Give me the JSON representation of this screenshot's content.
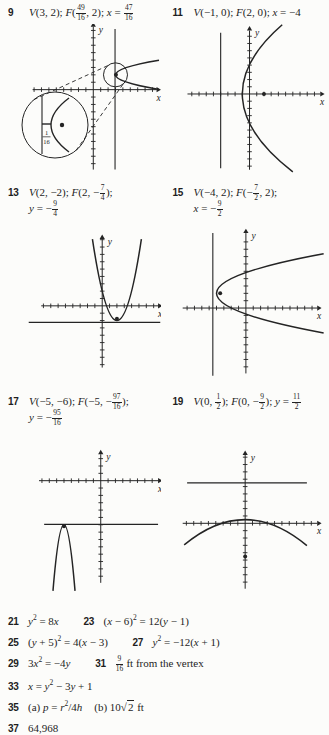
{
  "colors": {
    "ink": "#242424",
    "paper": "#fcfcfa"
  },
  "rows": [
    {
      "items": [
        {
          "num": "9",
          "lines": [
            [
              {
                "i": "V"
              },
              {
                "t": "(3, 2); "
              },
              {
                "i": "F"
              },
              {
                "t": "("
              },
              {
                "f": [
                  "49",
                  "16"
                ]
              },
              {
                "t": ", 2); "
              },
              {
                "i": "x"
              },
              {
                "t": " = "
              },
              {
                "f": [
                  "47",
                  "16"
                ]
              }
            ]
          ]
        },
        {
          "num": "11",
          "lines": [
            [
              {
                "i": "V"
              },
              {
                "t": "(−1, 0); "
              },
              {
                "i": "F"
              },
              {
                "t": "(2, 0); "
              },
              {
                "i": "x"
              },
              {
                "t": " = −4"
              }
            ]
          ]
        }
      ]
    },
    {
      "items": [
        {
          "num": "13",
          "lines": [
            [
              {
                "i": "V"
              },
              {
                "t": "(2, −2); "
              },
              {
                "i": "F"
              },
              {
                "t": "(2, −"
              },
              {
                "f": [
                  "7",
                  "4"
                ]
              },
              {
                "t": ");"
              }
            ],
            [
              {
                "i": "y"
              },
              {
                "t": " = −"
              },
              {
                "f": [
                  "9",
                  "4"
                ]
              }
            ]
          ]
        },
        {
          "num": "15",
          "lines": [
            [
              {
                "i": "V"
              },
              {
                "t": "(−4, 2); "
              },
              {
                "i": "F"
              },
              {
                "t": "(−"
              },
              {
                "f": [
                  "7",
                  "2"
                ]
              },
              {
                "t": ", 2);"
              }
            ],
            [
              {
                "i": "x"
              },
              {
                "t": " = −"
              },
              {
                "f": [
                  "9",
                  "2"
                ]
              }
            ]
          ]
        }
      ]
    },
    {
      "items": [
        {
          "num": "17",
          "lines": [
            [
              {
                "i": "V"
              },
              {
                "t": "(−5, −6); "
              },
              {
                "i": "F"
              },
              {
                "t": "(−5, −"
              },
              {
                "f": [
                  "97",
                  "16"
                ]
              },
              {
                "t": ");"
              }
            ],
            [
              {
                "i": "y"
              },
              {
                "t": " = −"
              },
              {
                "f": [
                  "95",
                  "16"
                ]
              }
            ]
          ]
        },
        {
          "num": "19",
          "lines": [
            [
              {
                "i": "V"
              },
              {
                "t": "(0, "
              },
              {
                "f": [
                  "1",
                  "2"
                ]
              },
              {
                "t": "); "
              },
              {
                "i": "F"
              },
              {
                "t": "(0, −"
              },
              {
                "f": [
                  "9",
                  "2"
                ]
              },
              {
                "t": "); "
              },
              {
                "i": "y"
              },
              {
                "t": " = "
              },
              {
                "f": [
                  "11",
                  "2"
                ]
              }
            ]
          ]
        }
      ]
    }
  ],
  "bottom": {
    "lines": [
      {
        "items": [
          {
            "num": "21",
            "segs": [
              {
                "i": "y"
              },
              {
                "sup": "2"
              },
              {
                "t": " = 8"
              },
              {
                "i": "x"
              }
            ]
          },
          {
            "num": "23",
            "segs": [
              {
                "t": "("
              },
              {
                "i": "x"
              },
              {
                "t": " − 6)"
              },
              {
                "sup": "2"
              },
              {
                "t": " = 12("
              },
              {
                "i": "y"
              },
              {
                "t": " − 1)"
              }
            ]
          }
        ]
      },
      {
        "items": [
          {
            "num": "25",
            "segs": [
              {
                "t": "("
              },
              {
                "i": "y"
              },
              {
                "t": " + 5)"
              },
              {
                "sup": "2"
              },
              {
                "t": " = 4("
              },
              {
                "i": "x"
              },
              {
                "t": " − 3)"
              }
            ]
          },
          {
            "num": "27",
            "segs": [
              {
                "i": "y"
              },
              {
                "sup": "2"
              },
              {
                "t": " = −12("
              },
              {
                "i": "x"
              },
              {
                "t": " + 1)"
              }
            ]
          }
        ]
      },
      {
        "items": [
          {
            "num": "29",
            "segs": [
              {
                "t": "3"
              },
              {
                "i": "x"
              },
              {
                "sup": "2"
              },
              {
                "t": " = −4"
              },
              {
                "i": "y"
              }
            ]
          },
          {
            "num": "31",
            "segs": [
              {
                "f": [
                  "9",
                  "16"
                ]
              },
              {
                "t": " ft from the vertex"
              }
            ]
          }
        ]
      },
      {
        "items": [
          {
            "num": "33",
            "segs": [
              {
                "i": "x"
              },
              {
                "t": " = "
              },
              {
                "i": "y"
              },
              {
                "sup": "2"
              },
              {
                "t": " − 3"
              },
              {
                "i": "y"
              },
              {
                "t": " + 1"
              }
            ]
          }
        ]
      },
      {
        "items": [
          {
            "num": "35",
            "segs": [
              {
                "t": "(a) "
              },
              {
                "i": "p"
              },
              {
                "t": " = "
              },
              {
                "i": "r"
              },
              {
                "sup": "2"
              },
              {
                "t": "/4"
              },
              {
                "i": "h"
              },
              {
                "sp": 12
              },
              {
                "t": "(b) 10"
              },
              {
                "sqrt": "2"
              },
              {
                "t": " ft"
              }
            ]
          }
        ]
      },
      {
        "items": [
          {
            "num": "37",
            "segs": [
              {
                "t": "64,968"
              }
            ]
          }
        ]
      }
    ]
  },
  "graphs": [
    {
      "name": "graph-9",
      "x_label": "x",
      "y_label": "y",
      "x_range": [
        -12.2,
        9.15
      ],
      "y_range": [
        -11.4,
        8.87
      ],
      "x_axis": {
        "span": [
          -8.2,
          8.55
        ],
        "ticks": [
          -8,
          8
        ]
      },
      "y_axis": {
        "span": [
          -10.8,
          8.5
        ],
        "ticks": [
          -10,
          8
        ]
      },
      "directrix": {
        "dir": "v",
        "value": 2.94,
        "span": [
          -10.8,
          8.2
        ]
      },
      "parabola": {
        "orient": "right",
        "vertex": [
          3,
          2
        ],
        "coeff": 1.5,
        "range": [
          0.02,
          3.98
        ]
      },
      "focus": [
        3.06,
        2
      ],
      "inset": {
        "label": [
          "1",
          "16"
        ]
      }
    },
    {
      "name": "graph-11",
      "x_label": "x",
      "y_label": "y",
      "x_range": [
        -11.3,
        10.6
      ],
      "y_range": [
        -11.1,
        9.7
      ],
      "x_axis": {
        "span": [
          -8.6,
          9.8
        ],
        "ticks": [
          -8,
          9
        ]
      },
      "y_axis": {
        "span": [
          -10.5,
          8.8
        ],
        "ticks": [
          -10,
          8
        ]
      },
      "directrix": {
        "dir": "v",
        "value": -4,
        "span": [
          -10.3,
          8.5
        ]
      },
      "parabola": {
        "orient": "right",
        "vertex": [
          -1,
          0
        ],
        "coeff": 0.06,
        "range": [
          -10.8,
          9.6
        ]
      },
      "focus": [
        2,
        0
      ]
    },
    {
      "name": "graph-13",
      "x_label": "x",
      "y_label": "y",
      "x_range": [
        -13.5,
        8.0
      ],
      "y_range": [
        -11.0,
        11.0
      ],
      "x_axis": {
        "span": [
          -8.3,
          7.6
        ],
        "ticks": [
          -8,
          7
        ]
      },
      "y_axis": {
        "span": [
          -8.4,
          9.1
        ],
        "ticks": [
          -8,
          9
        ]
      },
      "directrix": {
        "dir": "h",
        "value": -2.25,
        "span": [
          -10,
          7.9
        ]
      },
      "parabola": {
        "orient": "up",
        "vertex": [
          2,
          -2
        ],
        "coeff": 1,
        "range": [
          -1.33,
          5.33
        ]
      },
      "focus": [
        2,
        -1.75
      ]
    },
    {
      "name": "graph-15",
      "x_label": "x",
      "y_label": "y",
      "x_range": [
        -10.6,
        10.9
      ],
      "y_range": [
        -10.7,
        11.3
      ],
      "x_axis": {
        "span": [
          -8.6,
          9.7
        ],
        "ticks": [
          -8,
          9
        ]
      },
      "y_axis": {
        "span": [
          -8.9,
          10.2
        ],
        "ticks": [
          -8,
          9
        ]
      },
      "directrix": {
        "dir": "v",
        "value": -4.5,
        "span": [
          -9.2,
          10.2
        ]
      },
      "parabola": {
        "orient": "right",
        "vertex": [
          -4,
          2
        ],
        "coeff": 0.5,
        "range": [
          -3.4,
          7.4
        ]
      },
      "focus": [
        -3.5,
        2
      ]
    },
    {
      "name": "graph-17",
      "x_label": "x",
      "y_label": "y",
      "x_range": [
        -13.3,
        8.2
      ],
      "y_range": [
        -16.6,
        5.4
      ],
      "x_axis": {
        "span": [
          -8.4,
          7.8
        ],
        "ticks": [
          -8,
          7
        ]
      },
      "y_axis": {
        "span": [
          -13.9,
          3.6
        ],
        "ticks": [
          -13,
          3
        ]
      },
      "directrix": {
        "dir": "h",
        "value": -5.94,
        "span": [
          -7.7,
          7.8
        ]
      },
      "parabola": {
        "orient": "up",
        "vertex": [
          -5,
          -6
        ],
        "coeff": -4,
        "range": [
          -6.5,
          -3.5
        ]
      },
      "focus": [
        -5,
        -6.2
      ]
    },
    {
      "name": "graph-19",
      "x_label": "x",
      "y_label": "y",
      "x_range": [
        -10.5,
        11.0
      ],
      "y_range": [
        -10.9,
        11.2
      ],
      "x_axis": {
        "span": [
          -8.5,
          9.8
        ],
        "ticks": [
          -8,
          9
        ]
      },
      "y_axis": {
        "span": [
          -8.9,
          9.3
        ],
        "ticks": [
          -8,
          9
        ]
      },
      "directrix": {
        "dir": "h",
        "value": 5.5,
        "span": [
          -7.9,
          8.4
        ]
      },
      "parabola": {
        "orient": "up",
        "vertex": [
          0,
          0.5
        ],
        "coeff": -0.05,
        "range": [
          -8.3,
          8.4
        ]
      },
      "focus": [
        0,
        -4.5
      ]
    }
  ]
}
